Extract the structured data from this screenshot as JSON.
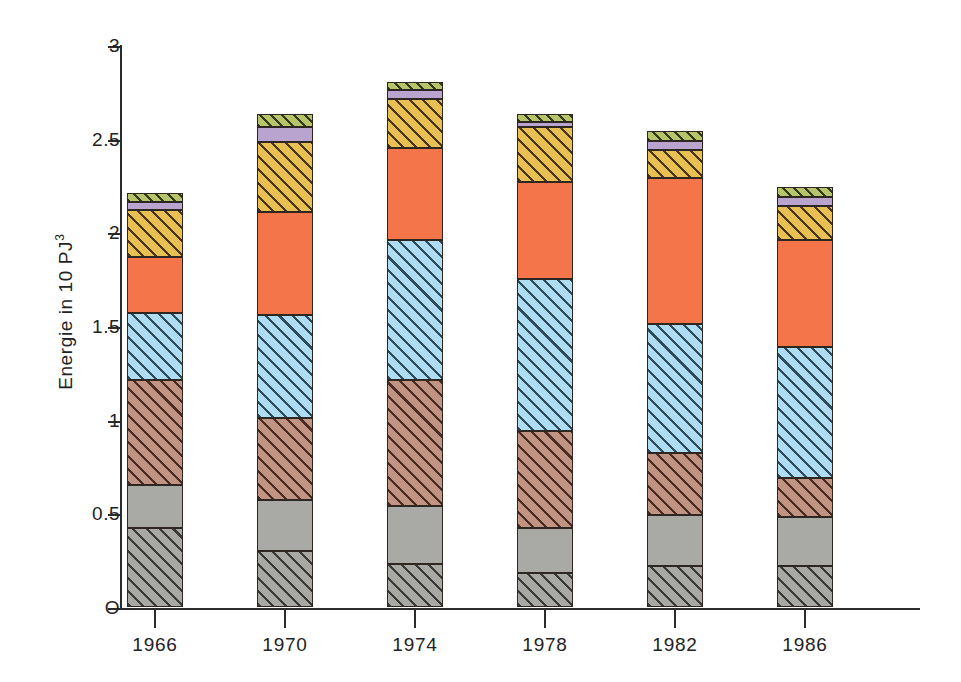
{
  "chart_data": {
    "type": "bar",
    "subtype": "stacked-bar",
    "title": "",
    "xlabel": "",
    "ylabel": "Energie in 10 PJ",
    "ylabel_superscript": "3",
    "categories": [
      "1966",
      "1970",
      "1974",
      "1978",
      "1982",
      "1986"
    ],
    "ylim": [
      0,
      3
    ],
    "ytick_values": [
      0,
      0.5,
      1,
      1.5,
      2,
      2.5,
      3
    ],
    "ytick_labels": [
      "O",
      "0.5",
      "1",
      "1.5",
      "2",
      "2.5",
      "3"
    ],
    "grid": false,
    "legend": "none",
    "stack_order": "bottom-to-top",
    "series": [
      {
        "name": "segment-1",
        "pattern": "hatched-grey",
        "color": "#a8a8a4",
        "hatch_color": "#3a3a38",
        "values": [
          0.42,
          0.3,
          0.23,
          0.18,
          0.22,
          0.22
        ]
      },
      {
        "name": "segment-2",
        "pattern": "solid-grey",
        "color": "#a9a9a6",
        "hatch_color": "",
        "values": [
          0.23,
          0.27,
          0.31,
          0.24,
          0.27,
          0.26
        ]
      },
      {
        "name": "segment-3",
        "pattern": "hatched-brown",
        "color": "#c09382",
        "hatch_color": "#4a2c22",
        "values": [
          0.56,
          0.44,
          0.67,
          0.52,
          0.33,
          0.21
        ]
      },
      {
        "name": "segment-4",
        "pattern": "hatched-blue",
        "color": "#aedcf2",
        "hatch_color": "#2f4a58",
        "values": [
          0.36,
          0.55,
          0.75,
          0.81,
          0.69,
          0.7
        ]
      },
      {
        "name": "segment-5",
        "pattern": "solid-orange",
        "color": "#f5754b",
        "hatch_color": "",
        "values": [
          0.3,
          0.55,
          0.49,
          0.52,
          0.78,
          0.57
        ]
      },
      {
        "name": "segment-6",
        "pattern": "hatched-yellow",
        "color": "#e8bf52",
        "hatch_color": "#4a3512",
        "values": [
          0.25,
          0.37,
          0.26,
          0.29,
          0.15,
          0.18
        ]
      },
      {
        "name": "segment-7",
        "pattern": "solid-purple",
        "color": "#b9a4cf",
        "hatch_color": "",
        "values": [
          0.04,
          0.08,
          0.05,
          0.03,
          0.05,
          0.05
        ]
      },
      {
        "name": "segment-8",
        "pattern": "hatched-green",
        "color": "#b7c46a",
        "hatch_color": "#333a16",
        "values": [
          0.05,
          0.07,
          0.04,
          0.04,
          0.05,
          0.05
        ]
      }
    ],
    "totals": [
      2.21,
      2.63,
      2.8,
      2.63,
      2.54,
      2.24
    ]
  }
}
